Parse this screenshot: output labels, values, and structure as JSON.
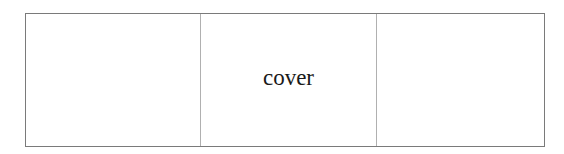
{
  "diagram": {
    "panels": [
      {
        "id": "left",
        "label": ""
      },
      {
        "id": "middle",
        "label": "cover"
      },
      {
        "id": "right",
        "label": ""
      }
    ],
    "colors": {
      "outer_border": "#7a7a7a",
      "divider": "#b0b0b0",
      "text": "#1a1a1a",
      "background": "#ffffff"
    }
  }
}
